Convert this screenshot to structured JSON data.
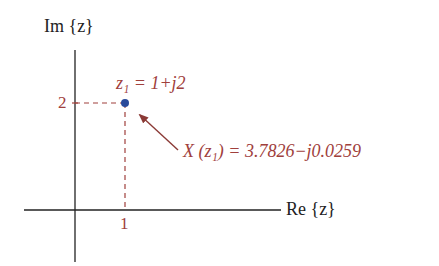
{
  "diagram": {
    "type": "complex-plane",
    "axes": {
      "y_label": "Im {z}",
      "x_label": "Re {z}"
    },
    "ticks": {
      "x_tick": "1",
      "y_tick": "2"
    },
    "point": {
      "label": "z₁ = 1+j2",
      "re": 1,
      "im": 2
    },
    "annotation": {
      "text": "X (z₁) = 3.7826−j0.0259"
    },
    "colors": {
      "axis": "#222222",
      "annotation": "#a0403c",
      "point": "#2a4a9a",
      "arrow": "#8b3a36"
    }
  }
}
